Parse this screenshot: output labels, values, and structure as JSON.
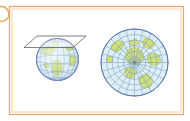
{
  "figure": {
    "name": "azimuthal-polar-projection-diagram",
    "kind": "diagram",
    "caption": "",
    "frame": {
      "outer_color": "#e8a860",
      "inner_color": "#f3c79a",
      "background": "#ffffff",
      "style": "double-line-rectangle"
    },
    "bullet": {
      "name": "list-bullet",
      "color": "#e8a860",
      "fill": "#ffffff",
      "shape": "circle",
      "clipped": "left-edge"
    }
  },
  "colors": {
    "land": "#cfe07a",
    "land_stroke": "#9ab648",
    "ocean": "#d8eef2",
    "ocean_edge": "#c2e3ea",
    "graticule": "#7a93c8",
    "graticule_globe": "#8aa3d0",
    "sphere_outline": "#6f87bd",
    "plane_stroke": "#555555",
    "plane_fill": "#ffffff",
    "map_outline": "#5d78b5"
  },
  "panels": [
    {
      "id": "globe-panel",
      "name": "globe-with-tangent-plane",
      "label": "",
      "description": "Sphere showing graticule with a tangent plane intersecting near the north pole",
      "center": {
        "x": 57.5,
        "y": 59.5
      },
      "radius": 21,
      "graticule": {
        "meridian_count": 12,
        "parallel_count": 7,
        "parallel_spacing_deg": 22.5,
        "meridian_spacing_deg": 30
      },
      "plane": {
        "name": "tangent-plane",
        "points": "24,47.5 37,36 86,36 73,47.5",
        "tangent_point": "north-pole"
      },
      "landmasses": [
        {
          "name": "north-america",
          "path": "M 41,50 L 44,47 L 50,46 L 55,48 L 54,52 L 50,55 L 46,54 L 43,53 Z"
        },
        {
          "name": "south-america",
          "path": "M 53,62 L 58,60 L 61,63 L 62,69 L 59,75 L 55,76 L 53,71 L 52,66 Z"
        },
        {
          "name": "greenland-rim",
          "path": "M 52,42 L 57,41 L 60,43 L 57,45 L 53,45 Z"
        },
        {
          "name": "africa-edge",
          "path": "M 70,56 L 75,55 L 77,59 L 75,65 L 71,66 L 69,61 Z"
        },
        {
          "name": "europe-sliver",
          "path": "M 66,47 L 72,46 L 74,49 L 69,51 L 66,50 Z"
        }
      ]
    },
    {
      "id": "map-panel",
      "name": "polar-azimuthal-map",
      "label": "",
      "description": "Azimuthal polar projection: concentric parallels and radial meridians converging at the pole",
      "center": {
        "x": 134.5,
        "y": 62.5
      },
      "radius": 33.5,
      "projection": "azimuthal-polar",
      "graticule": {
        "meridian_count": 24,
        "meridian_spacing_deg": 15,
        "parallel_rings": 6,
        "parallel_spacing_deg": 15
      },
      "pole_marker": {
        "name": "pole-center-point",
        "x": 134.5,
        "y": 62.5
      },
      "landmasses": [
        {
          "name": "landmass-upper-left",
          "path": "M 112,44 L 119,40 L 124,43 L 122,49 L 116,52 L 111,49 Z"
        },
        {
          "name": "landmass-upper-right",
          "path": "M 145,38 L 152,40 L 155,45 L 150,49 L 144,47 L 142,42 Z"
        },
        {
          "name": "landmass-central",
          "path": "M 127,50 L 135,47 L 142,51 L 144,59 L 138,65 L 130,64 L 125,58 Z"
        },
        {
          "name": "landmass-right",
          "path": "M 150,53 L 159,55 L 161,62 L 155,66 L 148,63 L 147,57 Z"
        },
        {
          "name": "landmass-lower-center",
          "path": "M 126,68 L 133,67 L 137,72 L 133,78 L 127,77 L 124,72 Z"
        },
        {
          "name": "landmass-lower-right",
          "path": "M 140,76 L 148,74 L 153,80 L 150,87 L 143,88 L 139,82 Z"
        },
        {
          "name": "landmass-left-small",
          "path": "M 107,57 L 112,56 L 113,61 L 109,63 L 106,60 Z"
        }
      ]
    }
  ]
}
